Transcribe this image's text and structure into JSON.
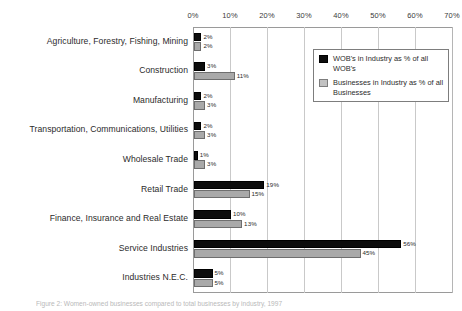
{
  "chart_data": {
    "type": "bar",
    "orientation": "horizontal",
    "title": "",
    "xlabel": "",
    "ylabel": "",
    "xlim": [
      0,
      70
    ],
    "xtick_labels": [
      "0%",
      "10%",
      "20%",
      "30%",
      "40%",
      "50%",
      "60%",
      "70%"
    ],
    "xticks": [
      0,
      10,
      20,
      30,
      40,
      50,
      60,
      70
    ],
    "grid": true,
    "legend_position": "upper right",
    "categories": [
      "Agriculture, Forestry, Fishing, Mining",
      "Construction",
      "Manufacturing",
      "Transportation, Communications, Utilities",
      "Wholesale Trade",
      "Retail Trade",
      "Finance, Insurance and Real Estate",
      "Service Industries",
      "Industries N.E.C."
    ],
    "series": [
      {
        "name": "WOB's in Industry as % of all WOB's",
        "color": "#0d0d0d",
        "values": [
          2,
          3,
          2,
          2,
          1,
          19,
          10,
          56,
          5
        ],
        "labels": [
          "2%",
          "3%",
          "2%",
          "2%",
          "1%",
          "19%",
          "10%",
          "56%",
          "5%"
        ]
      },
      {
        "name": "Businesses in Industry as % of all Businesses",
        "color": "#a9a9a9",
        "values": [
          2,
          11,
          3,
          3,
          3,
          15,
          13,
          45,
          5
        ],
        "labels": [
          "2%",
          "11%",
          "3%",
          "3%",
          "3%",
          "15%",
          "13%",
          "45%",
          "5%"
        ]
      }
    ]
  },
  "legend": {
    "items": [
      {
        "label": "WOB's in Industry as % of all WOB's",
        "swatch": "wob"
      },
      {
        "label": "Businesses in Industry as % of all Businesses",
        "swatch": "biz"
      }
    ]
  },
  "caption": {
    "text": "Figure 2: Women-owned businesses compared to total businesses by industry, 1997"
  }
}
